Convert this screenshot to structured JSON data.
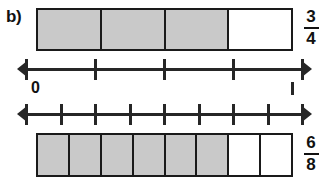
{
  "panel": {
    "label": "b)"
  },
  "colors": {
    "shaded_fill": "#c9c9c9",
    "unshaded_fill": "#ffffff",
    "stroke": "#1a1a1a",
    "axis": "#262626",
    "text": "#111111"
  },
  "top_model": {
    "name": "fraction-bar-fourths",
    "total_parts": 4,
    "shaded_parts": 3,
    "cells": [
      "shaded",
      "shaded",
      "shaded",
      "unshaded"
    ],
    "fraction": {
      "numerator": "3",
      "denominator": "4"
    }
  },
  "bottom_model": {
    "name": "fraction-bar-eighths",
    "total_parts": 8,
    "shaded_parts": 6,
    "cells": [
      "shaded",
      "shaded",
      "shaded",
      "shaded",
      "shaded",
      "shaded",
      "unshaded",
      "unshaded"
    ],
    "fraction": {
      "numerator": "6",
      "denominator": "8"
    }
  },
  "number_line_top": {
    "name": "number-line-fourths",
    "tick_count": 5,
    "intervals": 4,
    "left_arrow": true,
    "right_arrow": true
  },
  "number_line_bottom": {
    "name": "number-line-eighths",
    "tick_count": 9,
    "intervals": 8,
    "left_arrow": true,
    "right_arrow": true
  },
  "axis_labels": {
    "zero": "0",
    "end_mark": ""
  }
}
